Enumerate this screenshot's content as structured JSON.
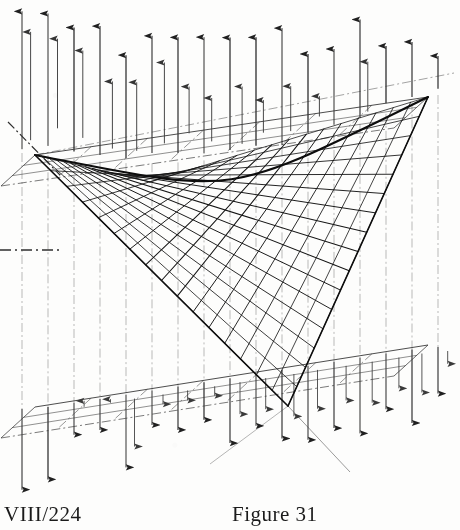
{
  "figure": {
    "kind": "technical-line-drawing",
    "ink_color": "#1a1a1a",
    "paper_color": "#fdfdfc",
    "caption_left": "VIII/224",
    "caption_right": "Figure 31",
    "caption_right_number": "31"
  },
  "captions": {
    "left": "VIII/224",
    "right": "Figure 31"
  },
  "chart_data": {
    "type": "line",
    "xlabel": "",
    "ylabel": "",
    "surface": {
      "name": "hyperbolic-paraboloid",
      "equation": "z = x*y",
      "corners": {
        "left": [
          35,
          155
        ],
        "right": [
          428,
          97
        ],
        "bottom": [
          288,
          406
        ],
        "top": [
          150,
          182
        ]
      },
      "ruling_families": 2,
      "rulings_per_family": 16
    },
    "bounding_box": {
      "top_face": [
        [
          35,
          155
        ],
        [
          428,
          97
        ],
        [
          395,
          127
        ],
        [
          18,
          186
        ]
      ],
      "bottom_face": [
        [
          35,
          407
        ],
        [
          428,
          345
        ],
        [
          395,
          378
        ],
        [
          18,
          438
        ]
      ],
      "depth_dx": -34,
      "depth_dy": 31
    },
    "vector_field": {
      "direction_upper": "up",
      "direction_lower": "down",
      "arrow_columns": 17,
      "arrow_color": "#202020"
    },
    "axes": {
      "dash_dot_axis": [
        [
          8,
          122
        ],
        [
          60,
          175
        ]
      ],
      "horizontal_tick_y": 250,
      "grid": true,
      "legend": "none"
    }
  }
}
